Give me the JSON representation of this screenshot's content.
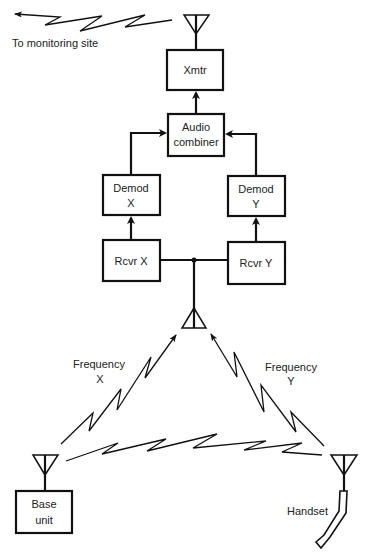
{
  "diagram": {
    "caption_uplink": "To monitoring site",
    "blocks": {
      "xmtr": [
        "Xmtr"
      ],
      "audio_combiner": [
        "Audio",
        "combiner"
      ],
      "demod_x": [
        "Demod",
        "X"
      ],
      "demod_y": [
        "Demod",
        "Y"
      ],
      "rcvr_x": [
        "Rcvr X"
      ],
      "rcvr_y": [
        "Rcvr Y"
      ],
      "base_unit": [
        "Base",
        "unit"
      ]
    },
    "labels": {
      "handset": "Handset",
      "freq_x": [
        "Frequency",
        "X"
      ],
      "freq_y": [
        "Frequency",
        "Y"
      ]
    },
    "connections": [
      {
        "from": "rcvr_x",
        "to": "demod_x"
      },
      {
        "from": "rcvr_y",
        "to": "demod_y"
      },
      {
        "from": "demod_x",
        "to": "audio_combiner"
      },
      {
        "from": "demod_y",
        "to": "audio_combiner"
      },
      {
        "from": "audio_combiner",
        "to": "xmtr"
      },
      {
        "from": "xmtr",
        "to": "monitoring_site",
        "type": "radio"
      },
      {
        "from": "base_unit",
        "to": "central_antenna",
        "type": "radio",
        "label": "Frequency X"
      },
      {
        "from": "handset",
        "to": "central_antenna",
        "type": "radio",
        "label": "Frequency Y"
      },
      {
        "from": "base_unit",
        "to": "handset",
        "type": "radio"
      }
    ]
  }
}
